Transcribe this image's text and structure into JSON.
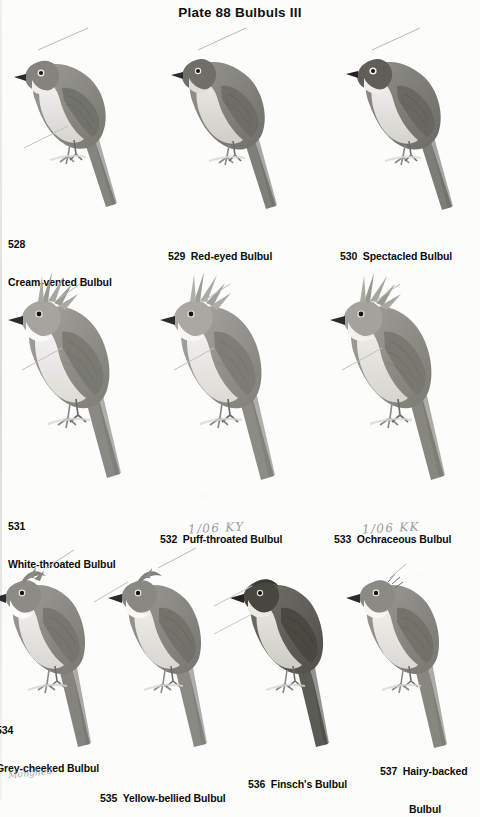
{
  "plate": {
    "title": "Plate 88  Bulbuls III"
  },
  "annotations": {
    "puff_throated_note": "1/06  KY",
    "ochraceous_note": "1/06  KK",
    "artist_signature": "Monghed"
  },
  "palette": {
    "background": "#fcfcfb",
    "ink": "#0d0d0d",
    "upperparts_mid": "#8e8d89",
    "upperparts_dark": "#6e6d69",
    "upperparts_light": "#a7a6a2",
    "underparts_pale": "#eceae6",
    "underparts_shadow": "#d8d6d1",
    "crown_dark": "#4e4d4a",
    "bill_dark": "#2c2b29",
    "tail_dark": "#7a7975",
    "pencil": "#8d8d92"
  },
  "birds": [
    {
      "number": "528",
      "name": "Cream-vented Bulbul",
      "caption_lines": [
        "528",
        "Cream-vented Bulbul"
      ],
      "caption_layout": "stacked",
      "row": 1,
      "col": 1,
      "crest": "none",
      "head_tone": "mid",
      "body_tone": "mid",
      "belly_tone": "pale",
      "eye": "pale-ring"
    },
    {
      "number": "529",
      "name": "Red-eyed Bulbul",
      "caption_lines": [
        "529  Red-eyed Bulbul"
      ],
      "caption_layout": "inline",
      "row": 1,
      "col": 2,
      "crest": "none",
      "head_tone": "mid",
      "body_tone": "mid",
      "belly_tone": "buff",
      "eye": "dark"
    },
    {
      "number": "530",
      "name": "Spectacled Bulbul",
      "caption_lines": [
        "530  Spectacled Bulbul"
      ],
      "caption_layout": "inline",
      "row": 1,
      "col": 3,
      "crest": "none",
      "head_tone": "dark",
      "body_tone": "mid",
      "belly_tone": "pale",
      "eye": "pale-ring"
    },
    {
      "number": "531",
      "name": "White-throated Bulbul",
      "caption_lines": [
        "531",
        "White-throated Bulbul"
      ],
      "caption_layout": "stacked",
      "row": 2,
      "col": 1,
      "crest": "tall-spiky",
      "head_tone": "light",
      "body_tone": "mid",
      "belly_tone": "pale",
      "eye": "dark"
    },
    {
      "number": "532",
      "name": "Puff-throated Bulbul",
      "caption_lines": [
        "532  Puff-throated Bulbul"
      ],
      "caption_layout": "inline",
      "row": 2,
      "col": 2,
      "crest": "tall-spiky",
      "head_tone": "light",
      "body_tone": "mid",
      "belly_tone": "pale",
      "eye": "dark"
    },
    {
      "number": "533",
      "name": "Ochraceous Bulbul",
      "caption_lines": [
        "533  Ochraceous Bulbul"
      ],
      "caption_layout": "inline",
      "row": 2,
      "col": 3,
      "crest": "tall-spiky",
      "head_tone": "light",
      "body_tone": "mid",
      "belly_tone": "buff",
      "eye": "dark"
    },
    {
      "number": "534",
      "name": "Grey-cheeked Bulbul",
      "caption_lines": [
        "534",
        "Grey-cheeked Bulbul"
      ],
      "caption_layout": "stacked",
      "row": 3,
      "col": 1,
      "crest": "low",
      "head_tone": "mid",
      "body_tone": "mid",
      "belly_tone": "pale",
      "eye": "dark"
    },
    {
      "number": "535",
      "name": "Yellow-bellied Bulbul",
      "caption_lines": [
        "535  Yellow-bellied Bulbul"
      ],
      "caption_layout": "inline",
      "row": 3,
      "col": 2,
      "crest": "low",
      "head_tone": "mid",
      "body_tone": "mid",
      "belly_tone": "pale",
      "eye": "dark"
    },
    {
      "number": "536",
      "name": "Finsch's Bulbul",
      "caption_lines": [
        "536  Finsch's Bulbul"
      ],
      "caption_layout": "inline",
      "row": 3,
      "col": 3,
      "crest": "none",
      "head_tone": "very-dark",
      "body_tone": "dark",
      "belly_tone": "pale",
      "eye": "dark"
    },
    {
      "number": "537",
      "name": "Hairy-backed Bulbul",
      "caption_lines": [
        "537  Hairy-backed",
        "Bulbul"
      ],
      "caption_layout": "stacked-indent",
      "row": 3,
      "col": 4,
      "crest": "none",
      "head_tone": "mid",
      "body_tone": "mid",
      "belly_tone": "pale",
      "eye": "dark"
    }
  ]
}
